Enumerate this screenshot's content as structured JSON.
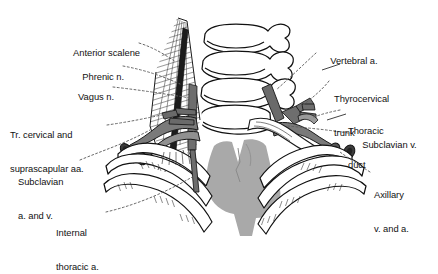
{
  "figure": {
    "type": "anatomical-illustration",
    "palette": {
      "background": "#ffffff",
      "outline": "#111111",
      "bone_fill": "#ffffff",
      "muscle_gray": "#b4b4b4",
      "vessel_gray": "#7d7d7d",
      "vessel_dark": "#4a4a4a",
      "mediastinum_gray": "#a9a9a9",
      "leader_line": "#6b6b6b"
    }
  },
  "labels": {
    "left": [
      {
        "id": "anterior-scalene",
        "text": "Anterior scalene",
        "lines": [
          "Anterior scalene"
        ]
      },
      {
        "id": "phrenic-nerve",
        "text": "Phrenic n.",
        "lines": [
          "Phrenic n."
        ]
      },
      {
        "id": "vagus-nerve",
        "text": "Vagus n.",
        "lines": [
          "Vagus n."
        ]
      },
      {
        "id": "transverse-cervical-suprascapular",
        "text": "Tr. cervical and suprascapular aa.",
        "lines": [
          "Tr. cervical and",
          "suprascapular aa."
        ]
      },
      {
        "id": "subclavian-a-and-v",
        "text": "Subclavian a. and v.",
        "lines": [
          "Subclavian",
          "a. and v."
        ]
      },
      {
        "id": "internal-thoracic-artery",
        "text": "Internal thoracic a.",
        "lines": [
          "Internal",
          "thoracic a."
        ]
      }
    ],
    "right": [
      {
        "id": "vertebral-artery",
        "text": "Vertebral a.",
        "lines": [
          "Vertebral a."
        ]
      },
      {
        "id": "thyrocervical-trunk",
        "text": "Thyrocervical trunk",
        "lines": [
          "Thyrocervical",
          "trunk"
        ]
      },
      {
        "id": "thoracic-duct",
        "text": "Thoracic duct",
        "lines": [
          "Thoracic",
          "duct"
        ]
      },
      {
        "id": "subclavian-vein",
        "text": "Subclavian v.",
        "lines": [
          "Subclavian v."
        ]
      },
      {
        "id": "axillary-v-and-a",
        "text": "Axillary v. and a.",
        "lines": [
          "Axillary",
          "v. and a."
        ]
      }
    ]
  },
  "label_text": {
    "anterior_scalene": "Anterior scalene",
    "phrenic_n": "Phrenic n.",
    "vagus_n": "Vagus n.",
    "tr_cervical_1": "Tr. cervical and",
    "tr_cervical_2": "suprascapular aa.",
    "subclavian_av_1": "Subclavian",
    "subclavian_av_2": "a. and v.",
    "internal_thoracic_1": "Internal",
    "internal_thoracic_2": "thoracic a.",
    "vertebral_a": "Vertebral a.",
    "thyrocervical_1": "Thyrocervical",
    "thyrocervical_2": "trunk",
    "thoracic_duct_1": "Thoracic",
    "thoracic_duct_2": "duct",
    "subclavian_v": "Subclavian v.",
    "axillary_1": "Axillary",
    "axillary_2": "v. and a."
  }
}
